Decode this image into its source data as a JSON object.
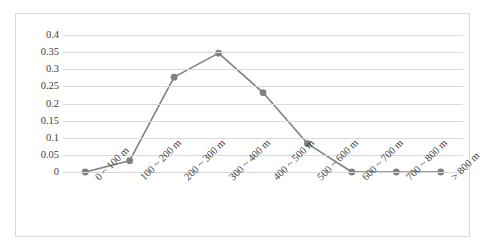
{
  "chart_data": {
    "type": "line",
    "title": "",
    "xlabel": "",
    "ylabel": "",
    "categories": [
      "0 ~ 100 m",
      "100 ~ 200 m",
      "200 ~ 300 m",
      "300 ~ 400 m",
      "400 ~ 500 m",
      "500 ~ 600 m",
      "600 ~ 700 m",
      "700 ~ 800 m",
      "> 800 m"
    ],
    "values": [
      0,
      0.033,
      0.277,
      0.347,
      0.232,
      0.083,
      0,
      0,
      0
    ],
    "ylim": [
      0,
      0.4
    ],
    "yticks": [
      0,
      0.05,
      0.1,
      0.15,
      0.2,
      0.25,
      0.3,
      0.35,
      0.4
    ],
    "ytick_labels": [
      "0",
      "0.05",
      "0.1",
      "0.15",
      "0.2",
      "0.25",
      "0.3",
      "0.35",
      "0.4"
    ],
    "grid": "horizontal",
    "legend": "none",
    "series_color": "#808080",
    "grid_color": "#d9d9d9",
    "border_color": "#d9d9d9",
    "background": "#ffffff",
    "marker": "circle"
  }
}
